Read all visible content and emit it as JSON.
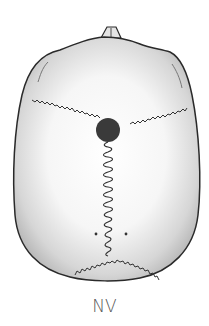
{
  "figure": {
    "label": "NV",
    "colors": {
      "outline": "#2a2a2a",
      "suture": "#333333",
      "bregma": "#3a3a3a",
      "shade_light": "#ffffff",
      "shade_dark": "#bdbdbd",
      "label": "#555555"
    }
  }
}
